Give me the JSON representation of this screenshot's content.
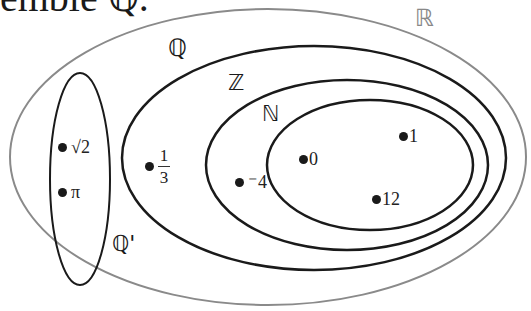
{
  "caption": "emble ℚ.",
  "sets": {
    "real": {
      "label": "ℝ",
      "stroke": "#8a8a8a"
    },
    "rational": {
      "label": "ℚ",
      "stroke": "#1a1a1a"
    },
    "integer": {
      "label": "ℤ",
      "stroke": "#1a1a1a"
    },
    "natural": {
      "label": "ℕ",
      "stroke": "#1a1a1a"
    },
    "irrational": {
      "label": "ℚ'",
      "stroke": "#1a1a1a"
    }
  },
  "points": {
    "sqrt2": "√2",
    "pi": "π",
    "one_third": {
      "num": "1",
      "den": "3"
    },
    "neg4": "⁻4",
    "zero": "0",
    "one": "1",
    "twelve": "12"
  }
}
